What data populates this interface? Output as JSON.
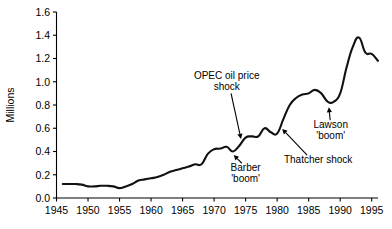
{
  "chart_data": {
    "type": "line",
    "title": "",
    "xlabel": "",
    "ylabel": "Millions",
    "xlim": [
      1945,
      1996
    ],
    "ylim": [
      0.0,
      1.6
    ],
    "grid": false,
    "legend": false,
    "x_ticks": [
      1945,
      1950,
      1955,
      1960,
      1965,
      1970,
      1975,
      1980,
      1985,
      1990,
      1995
    ],
    "x_tick_labels": [
      "1945",
      "1950",
      "1955",
      "1960",
      "1965",
      "1970",
      "1975",
      "1980",
      "1985",
      "1990",
      "1995"
    ],
    "y_ticks": [
      0.0,
      0.2,
      0.4,
      0.6,
      0.8,
      1.0,
      1.2,
      1.4,
      1.6
    ],
    "y_tick_labels": [
      "0.0",
      "0.2",
      "0.4",
      "0.6",
      "0.8",
      "1.0",
      "1.2",
      "1.4",
      "1.6"
    ],
    "line_color": "#111111",
    "series": [
      {
        "name": "Unemployment",
        "x": [
          1946,
          1947,
          1948,
          1949,
          1950,
          1951,
          1952,
          1953,
          1954,
          1955,
          1956,
          1957,
          1958,
          1959,
          1960,
          1961,
          1962,
          1963,
          1964,
          1965,
          1966,
          1967,
          1968,
          1969,
          1970,
          1971,
          1972,
          1973,
          1974,
          1975,
          1976,
          1977,
          1978,
          1979,
          1980,
          1981,
          1982,
          1983,
          1984,
          1985,
          1986,
          1987,
          1988,
          1989,
          1990,
          1991,
          1992,
          1993,
          1994,
          1995,
          1996
        ],
        "y": [
          0.12,
          0.12,
          0.12,
          0.115,
          0.1,
          0.1,
          0.105,
          0.105,
          0.1,
          0.085,
          0.1,
          0.12,
          0.15,
          0.16,
          0.17,
          0.18,
          0.2,
          0.225,
          0.24,
          0.255,
          0.27,
          0.29,
          0.29,
          0.38,
          0.42,
          0.425,
          0.44,
          0.4,
          0.45,
          0.52,
          0.53,
          0.53,
          0.6,
          0.565,
          0.555,
          0.68,
          0.8,
          0.86,
          0.89,
          0.9,
          0.93,
          0.9,
          0.83,
          0.83,
          0.9,
          1.12,
          1.3,
          1.38,
          1.25,
          1.24,
          1.18
        ]
      }
    ],
    "annotations": [
      {
        "id": "opec",
        "lines": [
          "OPEC oil price",
          "shock"
        ],
        "text_x": 1972.0,
        "text_y": 1.02,
        "point_x": 1974.3,
        "point_y": 0.5
      },
      {
        "id": "barber",
        "lines": [
          "Barber",
          "'boom'"
        ],
        "text_x": 1975.0,
        "text_y": 0.23,
        "point_x": 1973.0,
        "point_y": 0.375
      },
      {
        "id": "thatcher",
        "lines": [
          "Thatcher shock"
        ],
        "text_x": 1986.5,
        "text_y": 0.3,
        "point_x": 1980.7,
        "point_y": 0.6
      },
      {
        "id": "lawson",
        "lines": [
          "Lawson",
          "'boom'"
        ],
        "text_x": 1988.5,
        "text_y": 0.6,
        "point_x": 1988.2,
        "point_y": 0.79
      }
    ]
  }
}
